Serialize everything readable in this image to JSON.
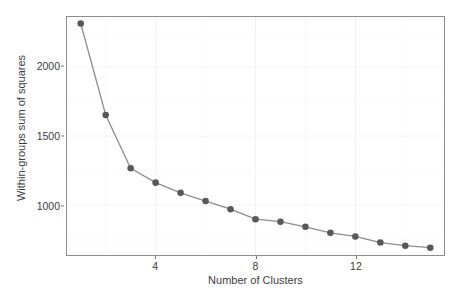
{
  "chart_data": {
    "type": "line",
    "title": "",
    "xlabel": "Number of Clusters",
    "ylabel": "Within-groups sum of squares",
    "x": [
      1,
      2,
      3,
      4,
      5,
      6,
      7,
      8,
      9,
      10,
      11,
      12,
      13,
      14,
      15
    ],
    "values": [
      2313,
      1652,
      1267,
      1163,
      1089,
      1030,
      971,
      899,
      881,
      844,
      800,
      774,
      730,
      707,
      693
    ],
    "series": [
      {
        "name": "Within-groups sum of squares",
        "values": [
          2313,
          1652,
          1267,
          1163,
          1089,
          1030,
          971,
          899,
          881,
          844,
          800,
          774,
          730,
          707,
          693
        ]
      }
    ],
    "xlim": [
      0.45,
      15.55
    ],
    "ylim": [
      640,
      2360
    ],
    "xticks": [
      4,
      8,
      12
    ],
    "xticklabels": [
      "4",
      "8",
      "12"
    ],
    "yticks": [
      1000,
      1500,
      2000
    ],
    "yticklabels": [
      "1000",
      "1500",
      "2000"
    ],
    "y_minor_ticks": [
      750,
      1250,
      1750,
      2250
    ],
    "x_minor_ticks": [
      2,
      6,
      10,
      14
    ],
    "grid": true,
    "legend": "none",
    "marker": "circle",
    "marker_color": "#585858",
    "line_color": "#8d8d8d",
    "panel_background": "#ffffff",
    "panel_border_color": "#8c8c8c",
    "grid_major_color": "#f2f2f2",
    "grid_minor_color": "#f8f8f8"
  }
}
